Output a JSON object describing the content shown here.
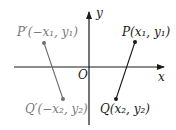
{
  "diagram": {
    "axes": {
      "x_label": "x",
      "y_label": "y",
      "origin_label": "O"
    },
    "points": {
      "P": {
        "label": "P(x₁, y₁)",
        "color": "#1a1a1a"
      },
      "Q": {
        "label": "Q(x₂, y₂)",
        "color": "#1a1a1a"
      },
      "P_prime": {
        "label": "P′(−x₁, y₁)",
        "color": "#7a7a7a"
      },
      "Q_prime": {
        "label": "Q′(−x₂, y₂)",
        "color": "#7a7a7a"
      }
    },
    "segments": [
      {
        "from": "P",
        "to": "Q"
      },
      {
        "from": "P_prime",
        "to": "Q_prime"
      }
    ]
  }
}
